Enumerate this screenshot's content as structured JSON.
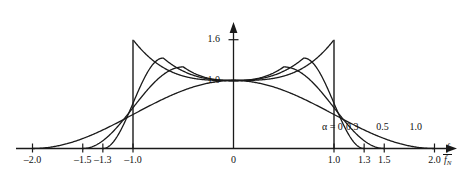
{
  "chart_data": {
    "type": "line",
    "title": "",
    "xlabel": "f / f_N",
    "ylabel": "|H(f)|",
    "xlim": [
      -2.35,
      2.35
    ],
    "ylim": [
      0,
      1.78
    ],
    "grid": false,
    "legend_position": "inside-lower-right",
    "x_ticks": [
      {
        "value": -2.0,
        "label": "–2.0"
      },
      {
        "value": -1.5,
        "label": "–1.5"
      },
      {
        "value": -1.3,
        "label": "–1.3"
      },
      {
        "value": -1.0,
        "label": "–1.0"
      },
      {
        "value": 0.0,
        "label": "0"
      },
      {
        "value": 1.0,
        "label": "1.0"
      },
      {
        "value": 1.3,
        "label": "1.3"
      },
      {
        "value": 1.5,
        "label": "1.5"
      },
      {
        "value": 2.0,
        "label": "2.0"
      }
    ],
    "y_ticks": [
      {
        "value": 1.0,
        "label": "1.0"
      },
      {
        "value": 1.6,
        "label": "1.6"
      }
    ],
    "axis_label_x_numerator": "f",
    "axis_label_x_denominator": "f",
    "axis_label_x_denominator_sub": "N",
    "axis_label_y": "|H( f )|",
    "annotations": [
      {
        "name": "alpha-0-label",
        "text": "α = 0",
        "x": 0.88,
        "y": 0.31
      },
      {
        "name": "alpha-03-label",
        "text": "0.3",
        "x": 1.12,
        "y": 0.31
      },
      {
        "name": "alpha-05-label",
        "text": "0.5",
        "x": 1.42,
        "y": 0.31
      },
      {
        "name": "alpha-10-label",
        "text": "1.0",
        "x": 1.75,
        "y": 0.31
      }
    ],
    "series": [
      {
        "name": "alpha = 0",
        "alpha": 0.0,
        "peak": 1.6,
        "cutoff": 1.0,
        "color": "#1a1a1a"
      },
      {
        "name": "alpha = 0.3",
        "alpha": 0.3,
        "peak": 1.33,
        "cutoff": 1.3,
        "color": "#1a1a1a"
      },
      {
        "name": "alpha = 0.5",
        "alpha": 0.5,
        "peak": 1.2,
        "cutoff": 1.5,
        "color": "#1a1a1a"
      },
      {
        "name": "alpha = 1.0",
        "alpha": 1.0,
        "peak": 1.0,
        "cutoff": 2.0,
        "color": "#1a1a1a"
      }
    ]
  },
  "figure": {
    "background": "#ffffff",
    "axis_color": "#1a1a1a",
    "curve_color": "#1a1a1a"
  }
}
